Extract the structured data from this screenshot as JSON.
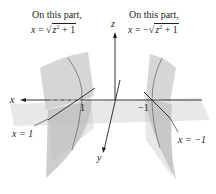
{
  "annotations": {
    "left_caption": "On this part,",
    "left_eq_lhs": "x",
    "left_eq_eq": " = ",
    "left_eq_rad": "z",
    "left_eq_exp": "2",
    "left_eq_tail": " + 1",
    "right_caption": "On this part,",
    "right_eq_lhs": "x",
    "right_eq_eq": " = −",
    "right_eq_rad": "z",
    "right_eq_exp": "2",
    "right_eq_tail": " + 1"
  },
  "axes": {
    "x_label": "x",
    "y_label": "y",
    "z_label": "z",
    "tick_pos": "1",
    "tick_neg": "−1"
  },
  "planes": {
    "left_plane_label": "x = 1",
    "right_plane_label": "x = −1"
  },
  "colors": {
    "surface": "#c9c9c9",
    "plane": "#d8d8d8",
    "axis": "#231f20",
    "curve": "#6d6d6d"
  }
}
